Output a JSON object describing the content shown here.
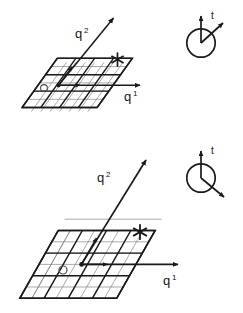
{
  "figure": {
    "title": "",
    "background_color": "#ffffff",
    "line_color": "#1a1a1a",
    "grid_minor_color": "#6b6b6b",
    "grid_major_color": "#1a1a1a"
  },
  "panels": [
    {
      "id": "top",
      "name": "upper-lattice-panel",
      "axes": {
        "horizontal": {
          "label_base": "q",
          "label_sup": "1",
          "name": "q1-axis"
        },
        "vertical": {
          "label_base": "q",
          "label_sup": "2",
          "name": "q2-axis"
        }
      },
      "markers": {
        "origin_dot": "filled-dot",
        "open_circle": "small-open-circle",
        "star": "six-point-asterisk",
        "basis_vector_1": "short-arrow-right",
        "basis_vector_2": "short-arrow-up"
      },
      "grid": {
        "cols": 8,
        "rows": 6,
        "major_every": 2
      },
      "clock": {
        "name": "orientation-circle-top",
        "axis_label": "t",
        "vertical_arrow": "up",
        "hand_arrow": "up-right",
        "hand_angle_deg": 45
      }
    },
    {
      "id": "bottom",
      "name": "lower-lattice-panel",
      "axes": {
        "horizontal": {
          "label_base": "q",
          "label_sup": "1",
          "name": "q1-axis"
        },
        "vertical": {
          "label_base": "q",
          "label_sup": "2",
          "name": "q2-axis"
        }
      },
      "markers": {
        "origin_dot": "filled-dot",
        "open_circle": "small-open-circle",
        "star": "six-point-asterisk",
        "basis_vector_1": "short-arrow-right",
        "basis_vector_2": "short-arrow-up"
      },
      "grid": {
        "cols": 8,
        "rows": 6,
        "major_every": 2
      },
      "clock": {
        "name": "orientation-circle-bottom",
        "axis_label": "t",
        "vertical_arrow": "up",
        "hand_arrow": "down-right",
        "hand_angle_deg": -40
      }
    }
  ],
  "labels": {
    "q_base": "q",
    "sup_one": "1",
    "sup_two": "2",
    "t": "t"
  }
}
